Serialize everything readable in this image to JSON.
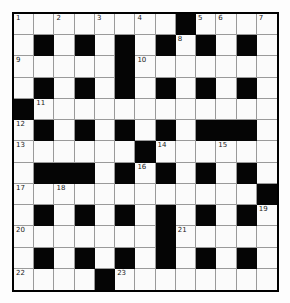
{
  "puzzle": {
    "rows": 13,
    "cols": 13,
    "colors": {
      "block": "#050505",
      "cell": "#fbfbfb",
      "gridline": "#9a9a9a",
      "border": "#000000"
    },
    "layout": [
      "WWWWWWWWBWWWW",
      "WBWBWBWBWBWBW",
      "WWWWWBWWWWWWW",
      "WBWBWBWBWBWBW",
      "BWWWWWWWWWWWW",
      "WBWBWBWBWBBBW",
      "WWWWWWBWWWWWW",
      "WBBBWBWBWBWBW",
      "WWWWWWWWWWWWB",
      "WBWBWBWBWBWBW",
      "WWWWWWWBWWWWW",
      "WBWBWBWBWBWBW",
      "WWWWBWWWWWWWW"
    ],
    "numbers": [
      {
        "row": 0,
        "col": 0,
        "n": "1"
      },
      {
        "row": 0,
        "col": 2,
        "n": "2"
      },
      {
        "row": 0,
        "col": 4,
        "n": "3"
      },
      {
        "row": 0,
        "col": 6,
        "n": "4"
      },
      {
        "row": 0,
        "col": 9,
        "n": "5"
      },
      {
        "row": 0,
        "col": 10,
        "n": "6"
      },
      {
        "row": 0,
        "col": 12,
        "n": "7"
      },
      {
        "row": 1,
        "col": 8,
        "n": "8"
      },
      {
        "row": 2,
        "col": 0,
        "n": "9"
      },
      {
        "row": 2,
        "col": 6,
        "n": "10"
      },
      {
        "row": 4,
        "col": 1,
        "n": "11"
      },
      {
        "row": 5,
        "col": 0,
        "n": "12"
      },
      {
        "row": 6,
        "col": 0,
        "n": "13"
      },
      {
        "row": 6,
        "col": 7,
        "n": "14"
      },
      {
        "row": 6,
        "col": 10,
        "n": "15"
      },
      {
        "row": 7,
        "col": 6,
        "n": "16"
      },
      {
        "row": 8,
        "col": 0,
        "n": "17"
      },
      {
        "row": 8,
        "col": 2,
        "n": "18"
      },
      {
        "row": 9,
        "col": 12,
        "n": "19"
      },
      {
        "row": 10,
        "col": 0,
        "n": "20"
      },
      {
        "row": 10,
        "col": 8,
        "n": "21"
      },
      {
        "row": 12,
        "col": 0,
        "n": "22"
      },
      {
        "row": 12,
        "col": 5,
        "n": "23"
      }
    ]
  }
}
